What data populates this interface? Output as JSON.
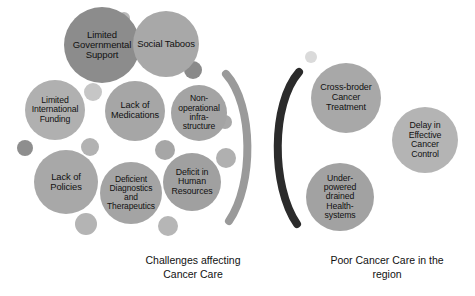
{
  "figure": {
    "type": "bubble-cluster-diagram",
    "background_color": "#ffffff",
    "palette": {
      "dark_gray_bubble": "#8c8c8c",
      "mid_gray_bubble": "#a0a0a0",
      "light_gray_bubble": "#b4b4b4",
      "pale_gray_bubble": "#c4c4c4",
      "dark_arc": "#2b2b2b",
      "light_arc": "#9a9a9a",
      "text_color": "#111111"
    }
  },
  "left_cluster": {
    "caption": "Challenges affecting\nCancer Care",
    "bubbles": [
      {
        "label": "Limited\nGovernmental\nSupport",
        "cx": 102,
        "cy": 45,
        "r": 38,
        "color": "#8c8c8c",
        "font_size": 9.5
      },
      {
        "label": "Social Taboos",
        "cx": 166,
        "cy": 44,
        "r": 33,
        "color": "#a8a8a8",
        "font_size": 9.5
      },
      {
        "label": "Limited\nInternational\nFunding",
        "cx": 55,
        "cy": 110,
        "r": 30,
        "color": "#b0b0b0",
        "font_size": 8.7
      },
      {
        "label": "Lack of\nMedications",
        "cx": 135,
        "cy": 111,
        "r": 30,
        "color": "#a6a6a6",
        "font_size": 9.2
      },
      {
        "label": "Non-\noperational\ninfra-\nstructure",
        "cx": 199,
        "cy": 113,
        "r": 28,
        "color": "#a4a4a4",
        "font_size": 8.6
      },
      {
        "label": "Lack of\nPolicies",
        "cx": 66,
        "cy": 182,
        "r": 32,
        "color": "#a8a8a8",
        "font_size": 9.4
      },
      {
        "label": "Deficient\nDiagnostics\nand\nTherapeutics",
        "cx": 131,
        "cy": 193,
        "r": 31,
        "color": "#a4a4a4",
        "font_size": 8.5
      },
      {
        "label": "Deficit in\nHuman\nResources",
        "cx": 192,
        "cy": 182,
        "r": 29,
        "color": "#a0a0a0",
        "font_size": 8.8
      }
    ],
    "dots": [
      {
        "cx": 124,
        "cy": 18,
        "r": 6,
        "color": "#b8b8b8"
      },
      {
        "cx": 93,
        "cy": 92,
        "r": 9,
        "color": "#c6c6c6"
      },
      {
        "cx": 193,
        "cy": 70,
        "r": 9,
        "color": "#8a8a8a"
      },
      {
        "cx": 25,
        "cy": 148,
        "r": 8,
        "color": "#8e8e8e"
      },
      {
        "cx": 90,
        "cy": 147,
        "r": 9,
        "color": "#b2b2b2"
      },
      {
        "cx": 165,
        "cy": 150,
        "r": 10,
        "color": "#a6a6a6"
      },
      {
        "cx": 226,
        "cy": 158,
        "r": 10,
        "color": "#b0b0b0"
      },
      {
        "cx": 168,
        "cy": 226,
        "r": 10,
        "color": "#b6b6b6"
      },
      {
        "cx": 86,
        "cy": 224,
        "r": 11,
        "color": "#b4b4b4"
      },
      {
        "cx": 225,
        "cy": 122,
        "r": 7,
        "color": "#a8a8a8"
      }
    ]
  },
  "right_cluster": {
    "caption": "Poor Cancer Care in the\nregion",
    "bubbles": [
      {
        "label": "Cross-broder\nCancer\nTreatment",
        "cx": 346,
        "cy": 98,
        "r": 35,
        "color": "#a8a8a8",
        "font_size": 9.0
      },
      {
        "label": "Delay in\nEffective\nCancer\nControl",
        "cx": 425,
        "cy": 140,
        "r": 33,
        "color": "#b4b4b4",
        "font_size": 8.8
      },
      {
        "label": "Under-\npowered\ndrained\nHealth-\nsystems",
        "cx": 340,
        "cy": 197,
        "r": 34,
        "color": "#a2a2a2",
        "font_size": 8.7
      }
    ],
    "dots": [
      {
        "cx": 311,
        "cy": 57,
        "r": 6,
        "color": "#dadada"
      }
    ]
  },
  "arcs": [
    {
      "name": "light-gray-arc",
      "color": "#9a9a9a",
      "stroke_width": 8,
      "path": "M 226 74 C 254 105 254 185 229 221"
    },
    {
      "name": "dark-gray-arc",
      "color": "#2b2b2b",
      "stroke_width": 8,
      "path": "M 299 72 C 271 104 271 186 297 224"
    }
  ]
}
